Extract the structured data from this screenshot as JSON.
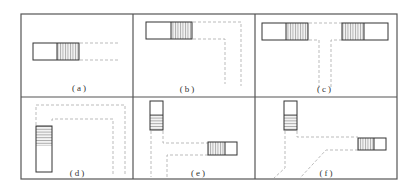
{
  "figure": {
    "frame_color": "#555555",
    "line_color": "#333333",
    "dash_color": "#999999",
    "panels": [
      {
        "id": "a",
        "label": "(a)",
        "description": "single straight run extending right"
      },
      {
        "id": "b",
        "label": "(b)",
        "description": "straight run turning down (L-shape)"
      },
      {
        "id": "c",
        "label": "(c)",
        "description": "two opposing units with T-junction stem"
      },
      {
        "id": "d",
        "label": "(d)",
        "description": "vertical unit with inverted-U path"
      },
      {
        "id": "e",
        "label": "(e)",
        "description": "vertical and horizontal units with orthogonal paths"
      },
      {
        "id": "f",
        "label": "(f)",
        "description": "vertical and horizontal units with diagonal paths"
      }
    ]
  }
}
